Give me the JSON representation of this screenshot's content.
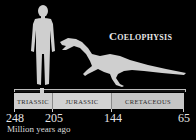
{
  "title": "Coelophysis",
  "figures": {
    "human": "human-silhouette",
    "dinosaur": "coelophysis-silhouette"
  },
  "timeline": {
    "periods": [
      {
        "label": "TRIASSIC"
      },
      {
        "label": "JURASSIC"
      },
      {
        "label": "CRETACEOUS"
      }
    ],
    "ticks": [
      "248",
      "205",
      "144",
      "65"
    ],
    "unit_label": "Million years ago"
  },
  "colors": {
    "background": "#000000",
    "silhouette": "#cfcfcf",
    "band": "#c9c9c9"
  }
}
